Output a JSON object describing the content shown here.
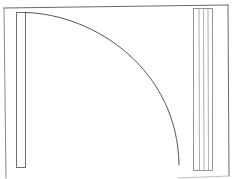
{
  "diagram": {
    "type": "floor-plan-door-swing",
    "colors": {
      "background": "#ffffff",
      "frame": "#707070",
      "panel": "#8a8a8a",
      "arc": "#555555"
    },
    "elements": {
      "frame": "outer-wall-frame",
      "left_leaf": "door-leaf-left",
      "swing_arc": "door-swing-arc",
      "right_stack": "sliding-panel-stack"
    }
  }
}
